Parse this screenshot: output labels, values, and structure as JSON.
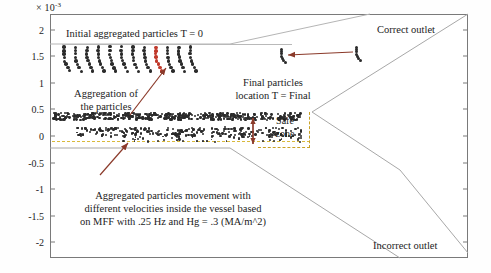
{
  "figure": {
    "axis": {
      "exponent_label": "× 10",
      "exponent_sup": "-3",
      "y_ticks": [
        "2",
        "1.5",
        "1",
        "0.5",
        "0",
        "-0.5",
        "-1",
        "-1.5",
        "-2"
      ],
      "y_values": [
        2,
        1.5,
        1,
        0.5,
        0,
        -0.5,
        -1,
        -1.5,
        -2
      ],
      "y_range": [
        -2.3,
        2.3
      ],
      "frame_color": "#7a7a7a"
    },
    "annotations": {
      "initial_particles": "Initial aggregated particles T = 0",
      "aggregation_line1": "Aggregation of",
      "aggregation_line2": "the particles",
      "final_line1": "Final particles",
      "final_line2": "location T = Final",
      "safe_zone_line1": "Safe",
      "safe_zone_line2": "zone",
      "correct_outlet": "Correct outlet",
      "incorrect_outlet": "Incorrect outlet",
      "caption_line1": "Aggregated particles movement with",
      "caption_line2": "different velocities inside the vessel based",
      "caption_line3": "on MFF with .25 Hz and Hg = .3 (MA/m^2)"
    },
    "colors": {
      "particle": "#2b2b2b",
      "highlight_particle": "#c0392b",
      "arrow": "#8b3a2a",
      "safe_zone": "#c9a227",
      "dashed_zero_line": "#d9b93c",
      "vessel_wall": "#a8a8a8",
      "frame": "#7a7a7a"
    },
    "chart_data": {
      "type": "scatter",
      "title": "",
      "xlabel": "",
      "ylabel": "",
      "y_exponent": -3,
      "ylim": [
        -2.3,
        2.3
      ],
      "grid": false,
      "legend": "none",
      "series": [
        {
          "name": "initial aggregated particle chains T = 0",
          "description": "12 slanted chain clusters at y ≈ 1.35 to 1.65 e-3, one highlighted red",
          "y_center": 1.5,
          "x_pixel_start": 62,
          "x_pixel_end": 200,
          "chain_count": 12,
          "highlight_index": 8
        },
        {
          "name": "dense upper particle band",
          "description": "dense horizontal band of particles just below y = 0.5e-3",
          "y_center": 0.42,
          "x_pixel_start": 52,
          "x_pixel_end": 300
        },
        {
          "name": "lower dispersed particle band",
          "description": "sparser band of particles between y = 0 and y = 0.3e-3",
          "y_center": 0.15,
          "x_pixel_start": 78,
          "x_pixel_end": 300
        },
        {
          "name": "final particle locations T = Final",
          "description": "two isolated chains in the correct outlet channel",
          "points": [
            [
              280,
              1.78
            ],
            [
              355,
              1.82
            ]
          ]
        }
      ]
    }
  }
}
